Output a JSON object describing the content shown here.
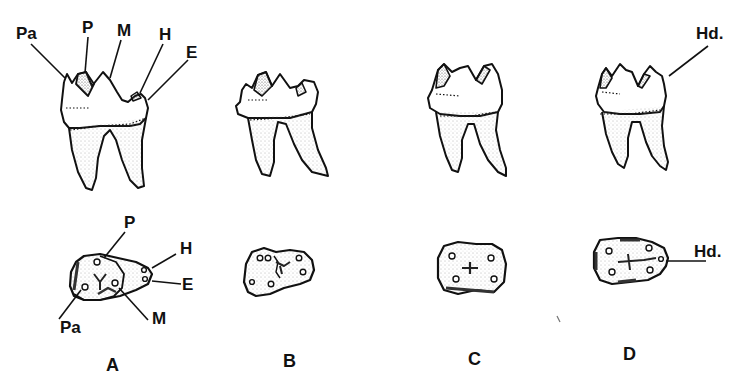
{
  "figure": {
    "colors": {
      "ink": "#111111",
      "stipple": "#555555",
      "background": "#ffffff"
    },
    "panels": [
      {
        "id": "A",
        "label": "A",
        "lateral_labels": [
          "Pa",
          "P",
          "M",
          "H",
          "E"
        ],
        "occlusal_labels": [
          "P",
          "H",
          "E",
          "Pa",
          "M"
        ]
      },
      {
        "id": "B",
        "label": "B",
        "lateral_labels": [],
        "occlusal_labels": []
      },
      {
        "id": "C",
        "label": "C",
        "lateral_labels": [],
        "occlusal_labels": []
      },
      {
        "id": "D",
        "label": "D",
        "lateral_labels": [
          "Hd."
        ],
        "occlusal_labels": [
          "Hd."
        ]
      }
    ]
  }
}
